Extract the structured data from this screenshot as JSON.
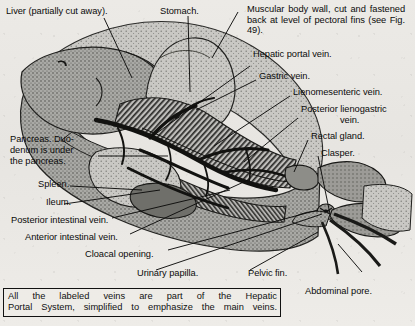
{
  "figure": {
    "type": "anatomical-illustration",
    "style": "halftone engraving on aged paper"
  },
  "labels": {
    "liver": "Liver (partially cut away).",
    "stomach": "Stomach.",
    "body_wall": "Muscular body wall, cut and fastened back at level of pectoral fins (see Fig. 49).",
    "hepatic_portal_vein": "Hepatic portal vein.",
    "gastric_vein": "Gastric vein.",
    "lienomesenteric_vein": "Lienomesenteric vein.",
    "posterior_lienogastric_vein_l1": "Posterior lienogastric",
    "posterior_lienogastric_vein_l2": "vein.",
    "rectal_gland": "Rectal gland.",
    "clasper": "Clasper.",
    "pancreas_l1": "Pancreas. Duo-",
    "pancreas_l2": "denum is under",
    "pancreas_l3": "the pancreas.",
    "spleen": "Spleen.",
    "ileum": "Ileum.",
    "posterior_intestinal_vein": "Posterior intestinal vein.",
    "anterior_intestinal_vein": "Anterior intestinal vein.",
    "cloacal_opening": "Cloacal opening.",
    "urinary_papilla": "Urinary papilla.",
    "pelvic_fin": "Pelvic fin.",
    "abdominal_pore": "Abdominal pore."
  },
  "caption": {
    "line1": "All the labeled veins are part of the Hepatic",
    "line2": "Portal System, simplified to emphasize the main veins."
  },
  "colors": {
    "paper": "#e9e8e4",
    "ink": "#111111",
    "organ_grey": "#8f8f8c",
    "organ_dark": "#3a3a38",
    "vein_black": "#141414"
  }
}
